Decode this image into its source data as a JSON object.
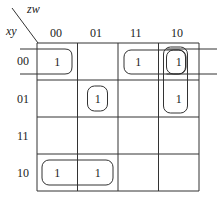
{
  "kmap": {
    "col_var": "zw",
    "row_var": "xy",
    "col_labels": [
      "00",
      "01",
      "11",
      "10"
    ],
    "row_labels": [
      "00",
      "01",
      "11",
      "10"
    ],
    "cells": [
      [
        "1",
        "",
        "1",
        "1"
      ],
      [
        "",
        "1",
        "",
        "1"
      ],
      [
        "",
        "",
        "",
        ""
      ],
      [
        "1",
        "1",
        "",
        ""
      ]
    ],
    "groups": [
      {
        "name": "group-row00-wrap",
        "cells": [
          [
            0,
            0
          ],
          [
            0,
            3
          ]
        ],
        "note": "wraps left-right edge"
      },
      {
        "name": "group-row00-11-10",
        "cells": [
          [
            0,
            2
          ],
          [
            0,
            3
          ]
        ]
      },
      {
        "name": "group-col10-rows00-01",
        "cells": [
          [
            0,
            3
          ],
          [
            1,
            3
          ]
        ]
      },
      {
        "name": "group-single-01-01",
        "cells": [
          [
            1,
            1
          ]
        ]
      },
      {
        "name": "group-row10-00-01",
        "cells": [
          [
            3,
            0
          ],
          [
            3,
            1
          ]
        ]
      }
    ]
  }
}
